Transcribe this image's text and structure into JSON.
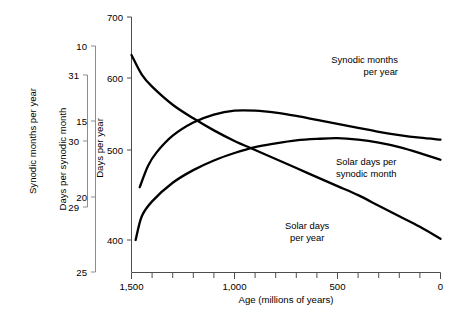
{
  "chart_data": {
    "type": "line",
    "title": "",
    "xlabel": "Age (millions of years)",
    "xlim": [
      1500,
      0
    ],
    "x_major_ticks": [
      1500,
      1000,
      500,
      0
    ],
    "x_major_tick_labels": [
      "1,500",
      "1,000",
      "500",
      "0"
    ],
    "x_minor_tick_step": 100,
    "x_axis_reversed": true,
    "grid": false,
    "legend_position": "inline-labels",
    "axes": [
      {
        "id": "synodic-months-per-year",
        "label": "Synodic months per year",
        "position": "far-left",
        "ticks": [
          31,
          30,
          29
        ],
        "tick_labels": [
          "31",
          "30",
          "29"
        ],
        "lim": [
          31,
          29
        ]
      },
      {
        "id": "days-per-synodic-month",
        "label": "Days per synodic month",
        "position": "middle-left",
        "ticks": [
          10,
          15,
          20,
          25
        ],
        "tick_labels": [
          "10",
          "15",
          "20",
          "25"
        ],
        "lim": [
          10,
          25
        ]
      },
      {
        "id": "days-per-year",
        "label": "Days per year",
        "position": "main-left",
        "ticks": [
          700,
          600,
          500,
          400
        ],
        "tick_labels": [
          "700",
          "600",
          "500",
          "400"
        ],
        "lim": [
          700,
          380
        ]
      }
    ],
    "series": [
      {
        "name": "Solar days per year",
        "axis": "days-per-year",
        "label": "Solar days\nper year",
        "label_line1": "Solar days",
        "label_line2": "per year",
        "color": "#000000",
        "x": [
          1480,
          1450,
          1400,
          1300,
          1200,
          1100,
          1000,
          900,
          800,
          700,
          600,
          500,
          400,
          300,
          200,
          100,
          0
        ],
        "y": [
          400,
          432,
          452,
          477,
          494,
          507,
          517,
          525,
          530,
          534,
          536,
          537,
          535,
          531,
          525,
          517,
          508
        ]
      },
      {
        "name": "Solar days per synodic month",
        "axis": "days-per-synodic-month",
        "label": "Solar days per\nsynodic month",
        "label_line1": "Solar days per",
        "label_line2": "synodic month",
        "color": "#000000",
        "x": [
          1500,
          1450,
          1400,
          1300,
          1200,
          1100,
          1000,
          900,
          800,
          700,
          600,
          500,
          400,
          300,
          200,
          100,
          0
        ],
        "y": [
          10.6,
          11.9,
          12.7,
          13.9,
          14.8,
          15.6,
          16.3,
          16.9,
          17.5,
          18.1,
          18.7,
          19.3,
          19.9,
          20.6,
          21.3,
          22.0,
          22.8
        ]
      },
      {
        "name": "Synodic months per year",
        "axis": "synodic-months-per-year",
        "label": "Synodic months\nper year",
        "label_line1": "Synodic months",
        "label_line2": "per year",
        "color": "#000000",
        "x": [
          1460,
          1420,
          1380,
          1300,
          1200,
          1100,
          1000,
          900,
          800,
          700,
          600,
          500,
          400,
          300,
          200,
          100,
          0
        ],
        "y": [
          29.3,
          29.62,
          29.82,
          30.08,
          30.28,
          30.4,
          30.46,
          30.46,
          30.43,
          30.38,
          30.32,
          30.26,
          30.2,
          30.14,
          30.09,
          30.05,
          30.02
        ]
      }
    ]
  }
}
